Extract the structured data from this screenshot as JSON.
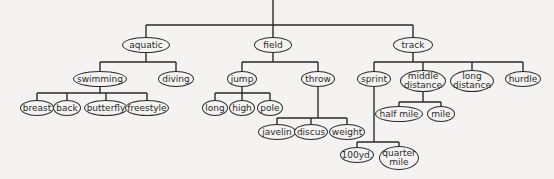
{
  "diagram": {
    "type": "tree",
    "line_color": "#2a2a2a",
    "background": "#f4f3f1",
    "root_stem": {
      "x": 273,
      "y1": 0,
      "y2": 25
    },
    "nodes": [
      {
        "id": "aquatic",
        "label": "aquatic",
        "x": 146,
        "y": 45,
        "w": 48,
        "h": 16,
        "parent": null
      },
      {
        "id": "field",
        "label": "field",
        "x": 273,
        "y": 45,
        "w": 38,
        "h": 16,
        "parent": null
      },
      {
        "id": "track",
        "label": "track",
        "x": 413,
        "y": 45,
        "w": 40,
        "h": 16,
        "parent": null
      },
      {
        "id": "swimming",
        "label": "swimming",
        "x": 100,
        "y": 79,
        "w": 54,
        "h": 16,
        "parent": "aquatic"
      },
      {
        "id": "diving",
        "label": "diving",
        "x": 176,
        "y": 79,
        "w": 36,
        "h": 16,
        "parent": "aquatic"
      },
      {
        "id": "jump",
        "label": "jump",
        "x": 242,
        "y": 79,
        "w": 30,
        "h": 16,
        "parent": "field"
      },
      {
        "id": "throw",
        "label": "throw",
        "x": 318,
        "y": 79,
        "w": 34,
        "h": 16,
        "parent": "field"
      },
      {
        "id": "sprint",
        "label": "sprint",
        "x": 374,
        "y": 79,
        "w": 34,
        "h": 16,
        "parent": "track"
      },
      {
        "id": "middle_distance",
        "label": "middle\ndistance",
        "x": 423,
        "y": 81,
        "w": 46,
        "h": 22,
        "parent": "track"
      },
      {
        "id": "long_distance",
        "label": "long\ndistance",
        "x": 472,
        "y": 81,
        "w": 44,
        "h": 22,
        "parent": "track"
      },
      {
        "id": "hurdle",
        "label": "hurdle",
        "x": 523,
        "y": 79,
        "w": 36,
        "h": 16,
        "parent": "track"
      },
      {
        "id": "breast",
        "label": "breast",
        "x": 37,
        "y": 108,
        "w": 34,
        "h": 16,
        "parent": "swimming"
      },
      {
        "id": "back",
        "label": "back",
        "x": 67,
        "y": 108,
        "w": 28,
        "h": 16,
        "parent": "swimming"
      },
      {
        "id": "butterfly",
        "label": "butterfly",
        "x": 106,
        "y": 108,
        "w": 44,
        "h": 16,
        "parent": "swimming"
      },
      {
        "id": "freestyle",
        "label": "freestyle",
        "x": 147,
        "y": 108,
        "w": 44,
        "h": 16,
        "parent": "swimming"
      },
      {
        "id": "long",
        "label": "long",
        "x": 215,
        "y": 108,
        "w": 26,
        "h": 16,
        "parent": "jump"
      },
      {
        "id": "high",
        "label": "high",
        "x": 242,
        "y": 108,
        "w": 26,
        "h": 16,
        "parent": "jump"
      },
      {
        "id": "pole",
        "label": "pole",
        "x": 270,
        "y": 108,
        "w": 26,
        "h": 16,
        "parent": "jump"
      },
      {
        "id": "half_mile",
        "label": "half mile",
        "x": 399,
        "y": 114,
        "w": 48,
        "h": 16,
        "parent": "middle_distance"
      },
      {
        "id": "mile",
        "label": "mile",
        "x": 441,
        "y": 114,
        "w": 28,
        "h": 16,
        "parent": "middle_distance"
      },
      {
        "id": "javelin",
        "label": "javelin",
        "x": 277,
        "y": 132,
        "w": 38,
        "h": 16,
        "parent": "throw"
      },
      {
        "id": "discus",
        "label": "discus",
        "x": 311,
        "y": 132,
        "w": 34,
        "h": 16,
        "parent": "throw"
      },
      {
        "id": "weight",
        "label": "weight",
        "x": 347,
        "y": 132,
        "w": 36,
        "h": 16,
        "parent": "throw"
      },
      {
        "id": "yd100",
        "label": "100yd.",
        "x": 357,
        "y": 155,
        "w": 34,
        "h": 16,
        "parent": "sprint"
      },
      {
        "id": "quarter_mile",
        "label": "quarter\nmile",
        "x": 399,
        "y": 158,
        "w": 40,
        "h": 24,
        "parent": "sprint"
      }
    ],
    "connectors": [
      {
        "parent": "root",
        "bar_y": 25,
        "from_y": 0,
        "parent_x": 273,
        "children": [
          "aquatic",
          "field",
          "track"
        ]
      },
      {
        "parent": "aquatic",
        "bar_y": 62,
        "children": [
          "swimming",
          "diving"
        ]
      },
      {
        "parent": "field",
        "bar_y": 62,
        "children": [
          "jump",
          "throw"
        ]
      },
      {
        "parent": "track",
        "bar_y": 62,
        "children": [
          "sprint",
          "middle_distance",
          "long_distance",
          "hurdle"
        ]
      },
      {
        "parent": "swimming",
        "bar_y": 93,
        "children": [
          "breast",
          "back",
          "butterfly",
          "freestyle"
        ]
      },
      {
        "parent": "jump",
        "bar_y": 93,
        "children": [
          "long",
          "high",
          "pole"
        ]
      },
      {
        "parent": "middle_distance",
        "bar_y": 102,
        "children": [
          "half_mile",
          "mile"
        ]
      },
      {
        "parent": "throw",
        "bar_y": 118,
        "children": [
          "javelin",
          "discus",
          "weight"
        ]
      },
      {
        "parent": "sprint",
        "bar_y": 142,
        "children": [
          "yd100",
          "quarter_mile"
        ]
      }
    ]
  }
}
